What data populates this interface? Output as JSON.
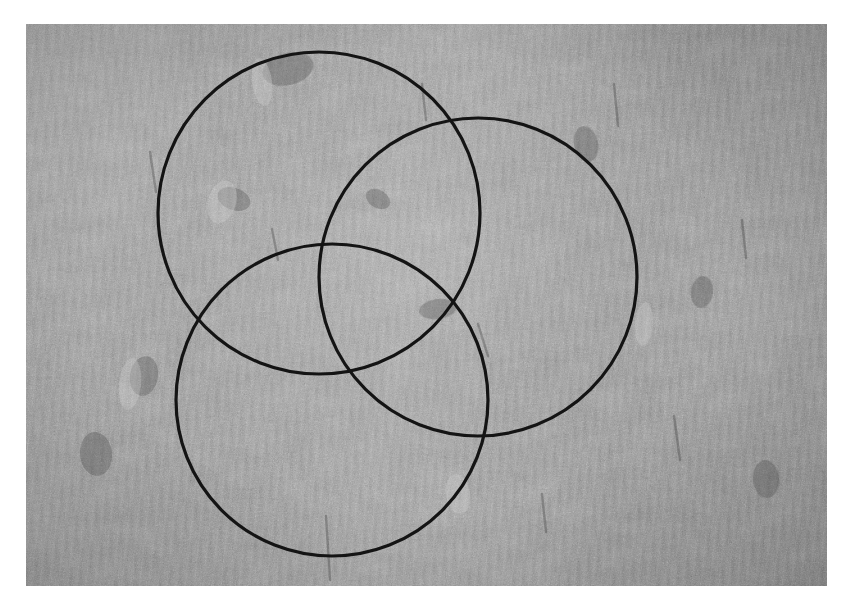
{
  "document": {
    "kind": "photograph-with-overlay",
    "title": "Grayscale photograph of a granular stone surface with three overlapping circles",
    "background_color": "#ffffff"
  },
  "photo": {
    "name": "surface-photograph",
    "alt_text": "Close-up grayscale photograph of a rough, sandy, granular rock surface with scattered shallow impressions and vertical scratch marks",
    "frame": {
      "x": 26,
      "y": 24,
      "width": 801,
      "height": 562
    },
    "palette": {
      "mid_tone": "#9a9a9a",
      "highlight": "#e0e0e0",
      "shadow": "#4a4a4a",
      "plate_border": "#8e8e8e"
    },
    "texture": {
      "type": "granular-sand-stone",
      "grain": "fine speckle",
      "striations": "near-vertical scratch marks",
      "lighting": "raking light from upper left"
    }
  },
  "overlay": {
    "name": "three-circle-venn-overlay",
    "stroke_color": "#141414",
    "stroke_width": 3.2,
    "fill": "none",
    "circles": [
      {
        "id": "circle-upper-left",
        "label": "A",
        "cx": 319,
        "cy": 213,
        "r": 161
      },
      {
        "id": "circle-upper-right",
        "label": "B",
        "cx": 478,
        "cy": 277,
        "r": 159
      },
      {
        "id": "circle-lower-left",
        "label": "C",
        "cx": 332,
        "cy": 400,
        "r": 156
      }
    ]
  },
  "chart_data": {
    "type": "scatter",
    "xlabel": "",
    "ylabel": "",
    "grid": false,
    "legend": "none",
    "xlim": [
      0,
      853
    ],
    "ylim": [
      0,
      613
    ],
    "series": [
      {
        "name": "circle-upper-left",
        "shape": "circle",
        "center": [
          319,
          213
        ],
        "radius": 161,
        "stroke": "#141414",
        "fill": "none"
      },
      {
        "name": "circle-upper-right",
        "shape": "circle",
        "center": [
          478,
          277
        ],
        "radius": 159,
        "stroke": "#141414",
        "fill": "none"
      },
      {
        "name": "circle-lower-left",
        "shape": "circle",
        "center": [
          332,
          400
        ],
        "radius": 156,
        "stroke": "#141414",
        "fill": "none"
      }
    ]
  }
}
